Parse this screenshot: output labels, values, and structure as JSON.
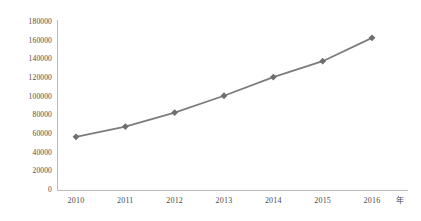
{
  "chart_data": {
    "type": "line",
    "title": "",
    "xlabel": "年",
    "ylabel": "",
    "categories": [
      "2010",
      "2011",
      "2012",
      "2013",
      "2014",
      "2015",
      "2016"
    ],
    "series": [
      {
        "name": "series-1",
        "values": [
          57000,
          68000,
          83000,
          101000,
          121000,
          138000,
          163000
        ]
      }
    ],
    "ylim": [
      0,
      180000
    ],
    "ytick_labels": [
      "0",
      "20000",
      "40000",
      "60000",
      "80000",
      "100000",
      "120000",
      "140000",
      "160000",
      "180000"
    ],
    "ytick_values": [
      0,
      20000,
      40000,
      60000,
      80000,
      100000,
      120000,
      140000,
      160000,
      180000
    ],
    "ytick_step": 20000,
    "grid": false,
    "legend": "none",
    "marker": "diamond",
    "line_color": "#7c7c7c",
    "marker_color": "#6e6e6e",
    "axis_color": "#bcbcbc",
    "text_color": "#4a4a4a",
    "background": "#ffffff"
  }
}
